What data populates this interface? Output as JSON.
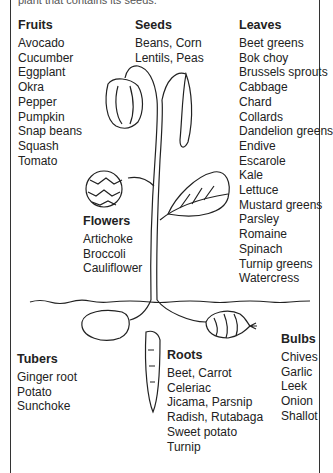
{
  "caption": "plant that contains its seeds.",
  "groups": {
    "fruits": {
      "title": "Fruits",
      "items": [
        "Avocado",
        "Cucumber",
        "Eggplant",
        "Okra",
        "Pepper",
        "Pumpkin",
        "Snap beans",
        "Squash",
        "Tomato"
      ]
    },
    "seeds": {
      "title": "Seeds",
      "items": [
        "Beans, Corn",
        "Lentils, Peas"
      ]
    },
    "leaves": {
      "title": "Leaves",
      "items": [
        "Beet greens",
        "Bok choy",
        "Brussels sprouts",
        "Cabbage",
        "Chard",
        "Collards",
        "Dandelion greens",
        "Endive",
        "Escarole",
        "Kale",
        "Lettuce",
        "Mustard greens",
        "Parsley",
        "Romaine",
        "Spinach",
        "Turnip greens",
        "Watercress"
      ]
    },
    "flowers": {
      "title": "Flowers",
      "items": [
        "Artichoke",
        "Broccoli",
        "Cauliflower"
      ]
    },
    "tubers": {
      "title": "Tubers",
      "items": [
        "Ginger root",
        "Potato",
        "Sunchoke"
      ]
    },
    "roots": {
      "title": "Roots",
      "items": [
        "Beet, Carrot",
        "Celeriac",
        "Jicama, Parsnip",
        "Radish, Rutabaga",
        "Sweet potato",
        "Turnip"
      ]
    },
    "bulbs": {
      "title": "Bulbs",
      "items": [
        "Chives",
        "Garlic",
        "Leek",
        "Onion",
        "Shallot"
      ]
    }
  }
}
